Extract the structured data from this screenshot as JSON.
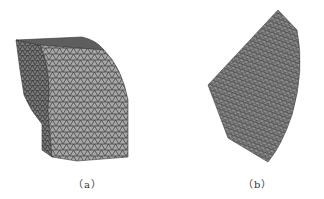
{
  "figure": {
    "panels": [
      {
        "id": "a",
        "label": "（a）",
        "description": "3D tetrahedral finite element mesh of a curved block with stepped base",
        "colors": {
          "fill_light": "#a9a9a9",
          "fill_dark": "#6a6a6a",
          "mesh_line": "#2e2e2e"
        }
      },
      {
        "id": "b",
        "label": "（b）",
        "description": "3D tetrahedral finite element mesh of a curved wedge-shaped section",
        "colors": {
          "fill": "#8f8f8f",
          "mesh_line": "#3a3a3a"
        }
      }
    ]
  }
}
